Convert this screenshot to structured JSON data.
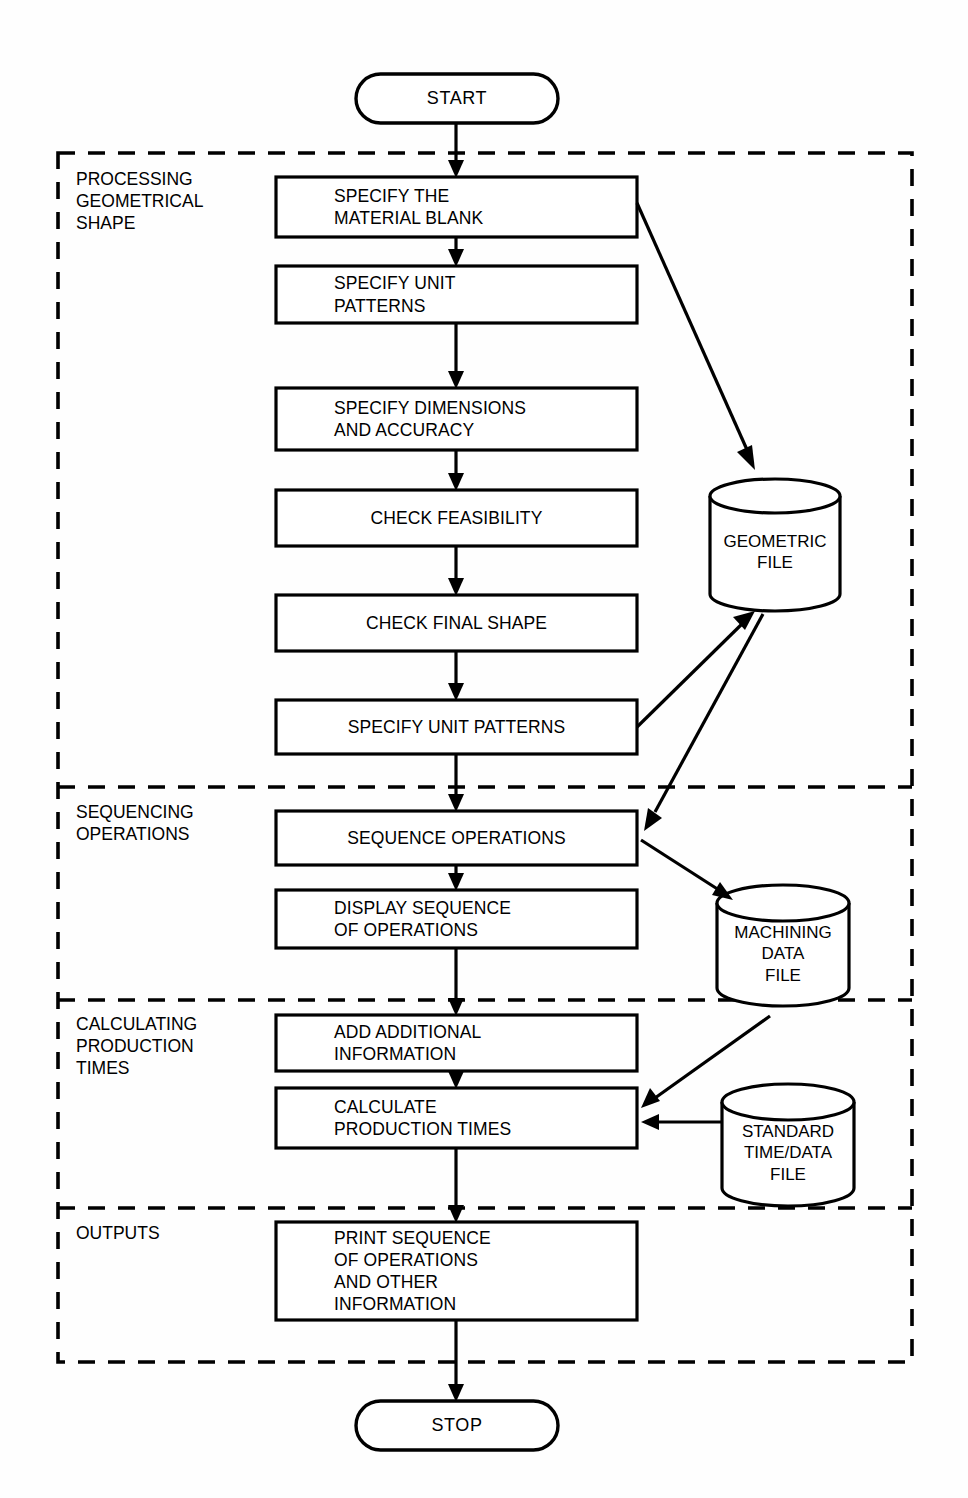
{
  "diagram": {
    "start_terminator": {
      "label": "START"
    },
    "stop_terminator": {
      "label": "STOP"
    },
    "zones": [
      {
        "id": "processing-geometrical-shape",
        "label": "PROCESSING\nGEOMETRICAL\nSHAPE"
      },
      {
        "id": "sequencing-operations",
        "label": "SEQUENCING\nOPERATIONS"
      },
      {
        "id": "calculating-production-times",
        "label": "CALCULATING\nPRODUCTION\nTIMES"
      },
      {
        "id": "outputs",
        "label": "OUTPUTS"
      }
    ],
    "process_steps": [
      {
        "id": "specify-material-blank",
        "label": "SPECIFY THE\nMATERIAL BLANK",
        "align": "left"
      },
      {
        "id": "specify-unit-patterns-1",
        "label": "SPECIFY UNIT\nPATTERNS",
        "align": "left"
      },
      {
        "id": "specify-dimensions-accuracy",
        "label": "SPECIFY DIMENSIONS\nAND ACCURACY",
        "align": "left"
      },
      {
        "id": "check-feasibility",
        "label": "CHECK FEASIBILITY",
        "align": "center"
      },
      {
        "id": "check-final-shape",
        "label": "CHECK FINAL SHAPE",
        "align": "center"
      },
      {
        "id": "specify-unit-patterns-2",
        "label": "SPECIFY UNIT PATTERNS",
        "align": "center"
      },
      {
        "id": "sequence-operations",
        "label": "SEQUENCE OPERATIONS",
        "align": "center"
      },
      {
        "id": "display-sequence-of-operations",
        "label": "DISPLAY SEQUENCE\nOF OPERATIONS",
        "align": "left"
      },
      {
        "id": "add-additional-information",
        "label": "ADD ADDITIONAL\nINFORMATION",
        "align": "left"
      },
      {
        "id": "calculate-production-times",
        "label": "CALCULATE\nPRODUCTION TIMES",
        "align": "left"
      },
      {
        "id": "print-sequence-operations",
        "label": "PRINT SEQUENCE\nOF OPERATIONS\nAND OTHER\nINFORMATION",
        "align": "left"
      }
    ],
    "data_stores": [
      {
        "id": "geometric-file",
        "label": "GEOMETRIC\nFILE"
      },
      {
        "id": "machining-data-file",
        "label": "MACHINING\nDATA\nFILE"
      },
      {
        "id": "standard-time-data-file",
        "label": "STANDARD\nTIME/DATA\nFILE"
      }
    ],
    "colors": {
      "stroke": "#000000",
      "fill": "#ffffff",
      "background": "#fefefe"
    }
  }
}
